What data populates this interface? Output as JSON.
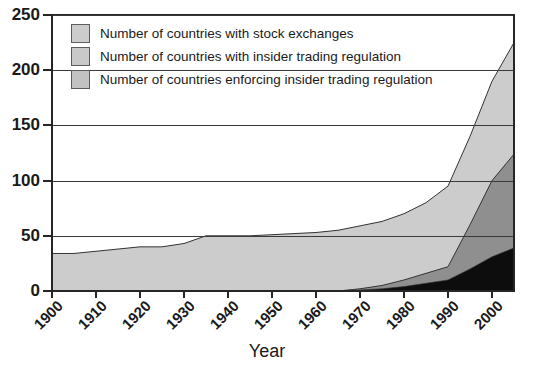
{
  "chart_data": {
    "type": "area",
    "title": "",
    "xlabel": "Year",
    "ylabel": "",
    "xlim": [
      1900,
      2005
    ],
    "ylim": [
      0,
      250
    ],
    "grid": true,
    "stacked": true,
    "legend_position": "top-left",
    "xticks": [
      "1900",
      "1910",
      "1920",
      "1930",
      "1940",
      "1950",
      "1960",
      "1970",
      "1980",
      "1990",
      "2000"
    ],
    "yticks": [
      "0",
      "50",
      "100",
      "150",
      "200",
      "250"
    ],
    "x": [
      1900,
      1905,
      1910,
      1915,
      1920,
      1925,
      1930,
      1935,
      1940,
      1945,
      1950,
      1955,
      1960,
      1965,
      1970,
      1975,
      1980,
      1985,
      1990,
      1995,
      2000,
      2005
    ],
    "series": [
      {
        "name": "Number of countries with stock exchanges",
        "color": "#cccccc",
        "values": [
          34,
          34,
          36,
          38,
          40,
          40,
          43,
          50,
          50,
          50,
          51,
          52,
          53,
          55,
          59,
          63,
          70,
          80,
          95,
          140,
          190,
          225
        ]
      },
      {
        "name": "Number of countries with insider trading regulation",
        "color": "#8f8f8f",
        "values": [
          0,
          0,
          0,
          0,
          0,
          0,
          0,
          0,
          0,
          0,
          0,
          0,
          0,
          0,
          2,
          5,
          10,
          16,
          22,
          60,
          100,
          124
        ]
      },
      {
        "name": "Number of countries enforcing insider trading regulation",
        "color": "#0d0d0d",
        "values": [
          0,
          0,
          0,
          0,
          0,
          0,
          0,
          0,
          0,
          0,
          0,
          0,
          0,
          0,
          1,
          2,
          4,
          7,
          10,
          20,
          31,
          39
        ]
      }
    ]
  },
  "legend": {
    "items": [
      {
        "label": "Number of countries with stock exchanges"
      },
      {
        "label": "Number of countries with insider trading regulation"
      },
      {
        "label": "Number of countries enforcing insider trading regulation"
      }
    ]
  },
  "axes": {
    "x_title": "Year"
  }
}
